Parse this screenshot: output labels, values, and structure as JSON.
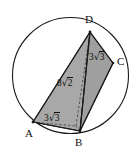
{
  "figure": {
    "type": "geometry-diagram",
    "colors": {
      "stroke": "#1a1a1a",
      "fill": "#a8a8a8",
      "fill_dark": "#9a9a9a",
      "background": "#ffffff",
      "text": "#101010"
    },
    "vertices": [
      {
        "id": "D",
        "label": "D",
        "x": 90,
        "y": 32
      },
      {
        "id": "C",
        "label": "C",
        "x": 113,
        "y": 63
      },
      {
        "id": "B",
        "label": "B",
        "x": 80,
        "y": 131
      },
      {
        "id": "A",
        "label": "A",
        "x": 33,
        "y": 122
      }
    ],
    "circle": {
      "cx": 70.5,
      "cy": 75.5,
      "r": 58
    },
    "edge_labels": [
      {
        "id": "dc",
        "coefficient": "3",
        "radical": "√",
        "radicand": "3",
        "text": "3√3"
      },
      {
        "id": "ad",
        "coefficient": "8",
        "radical": "√",
        "radicand": "2",
        "text": "8√2"
      },
      {
        "id": "ab",
        "coefficient": "3",
        "radical": "√",
        "radicand": "3",
        "text": "3√3"
      }
    ]
  }
}
